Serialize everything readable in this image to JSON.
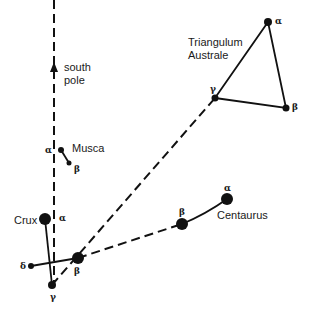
{
  "colors": {
    "ink": "#111111",
    "background": "#ffffff"
  },
  "labels": {
    "south": "south",
    "pole": "pole",
    "musca": "Musca",
    "crux": "Crux",
    "triangulum_1": "Triangulum",
    "triangulum_2": "Australe",
    "centaurus": "Centaurus"
  },
  "stars": {
    "musca_alpha": {
      "letter": "α",
      "x": 61,
      "y": 150,
      "r": 3
    },
    "musca_beta": {
      "letter": "β",
      "x": 69,
      "y": 163,
      "r": 2.5
    },
    "crux_alpha": {
      "letter": "α",
      "x": 45,
      "y": 219,
      "r": 6
    },
    "crux_beta": {
      "letter": "β",
      "x": 78,
      "y": 258,
      "r": 6
    },
    "crux_gamma": {
      "letter": "γ",
      "x": 52,
      "y": 285,
      "r": 4
    },
    "crux_delta": {
      "letter": "δ",
      "x": 31,
      "y": 266,
      "r": 3
    },
    "tra_alpha": {
      "letter": "α",
      "x": 268,
      "y": 22,
      "r": 4
    },
    "tra_beta": {
      "letter": "β",
      "x": 286,
      "y": 108,
      "r": 3.5
    },
    "tra_gamma": {
      "letter": "γ",
      "x": 215,
      "y": 98,
      "r": 3.5
    },
    "cen_alpha": {
      "letter": "α",
      "x": 227,
      "y": 199,
      "r": 6
    },
    "cen_beta": {
      "letter": "β",
      "x": 182,
      "y": 224,
      "r": 6
    }
  }
}
